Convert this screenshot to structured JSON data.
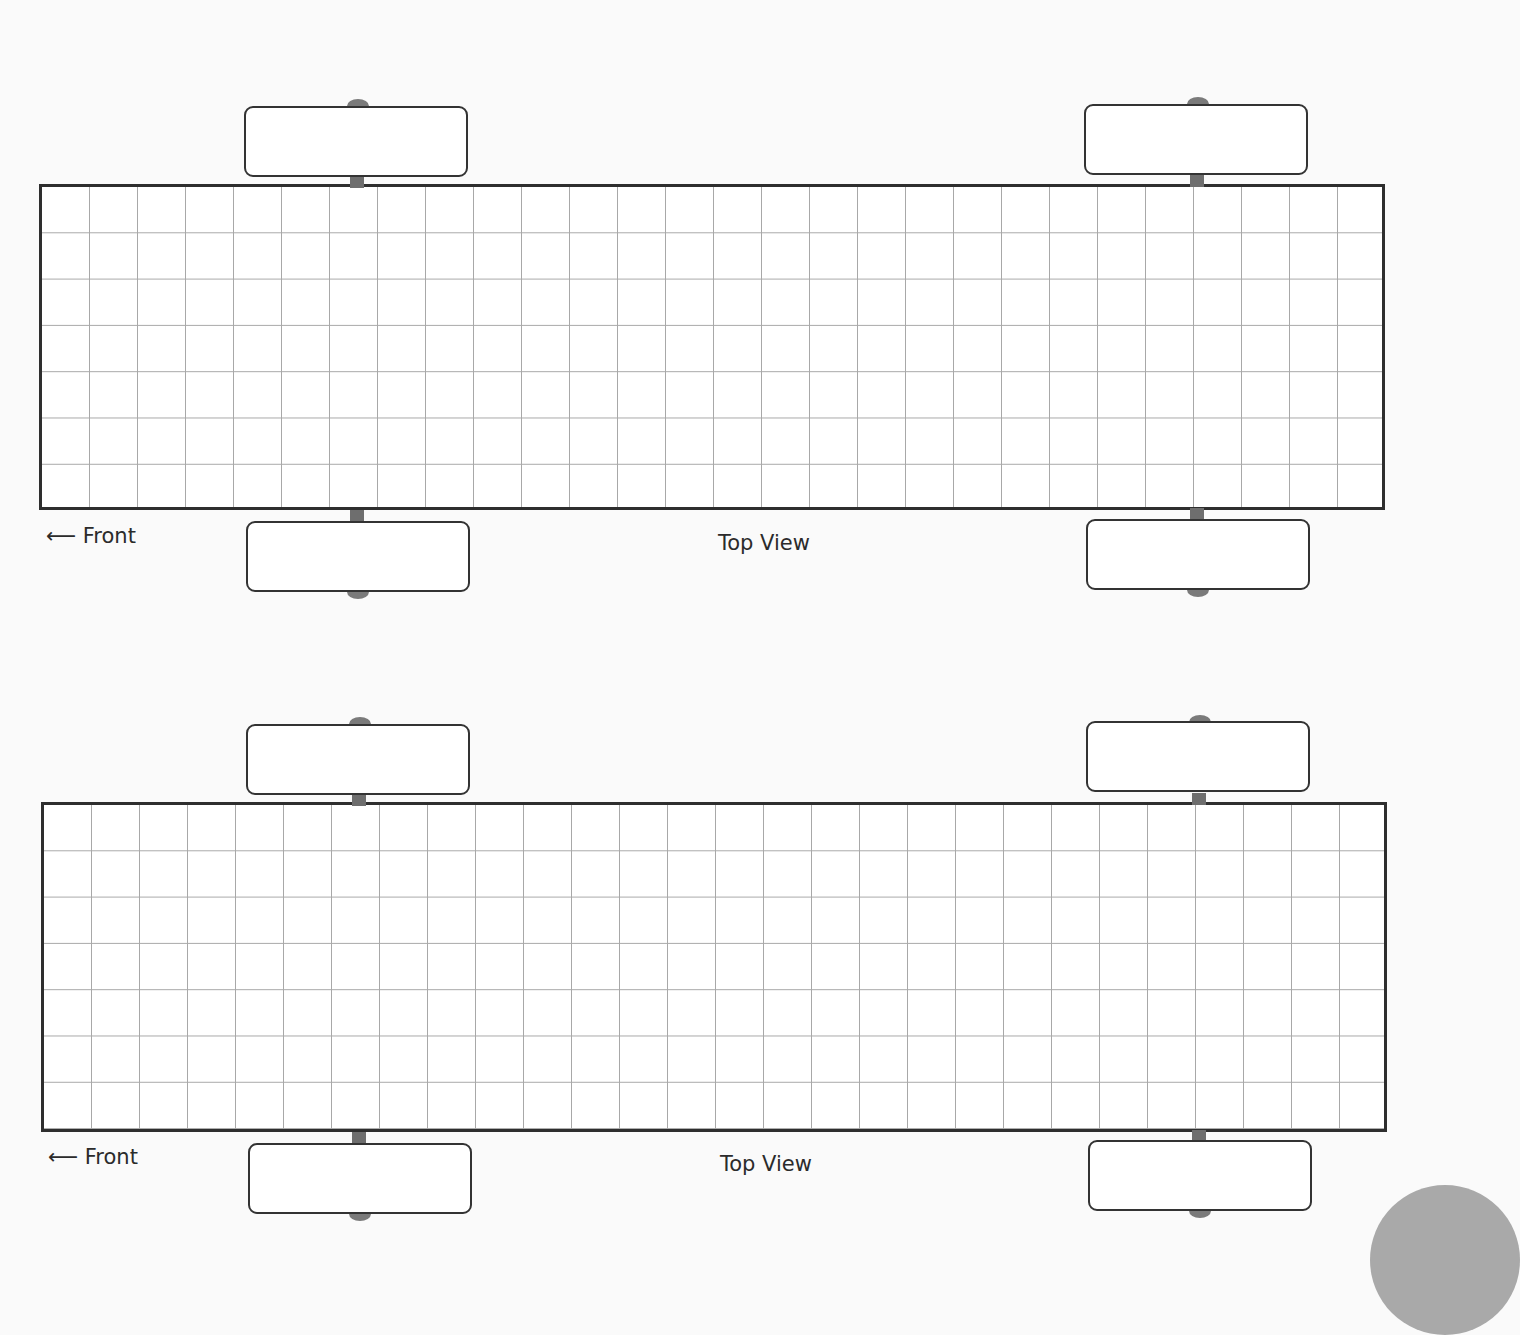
{
  "page": {
    "templates": [
      {
        "front_label": "⟵ Front",
        "view_label": "Top View"
      },
      {
        "front_label": "⟵ Front",
        "view_label": "Top View"
      }
    ],
    "grid": {
      "columns": 28,
      "rows": 7
    },
    "colors": {
      "outline": "#2e2e2e",
      "grid": "#a8a8a8",
      "axle": "#6e6e6e"
    }
  }
}
